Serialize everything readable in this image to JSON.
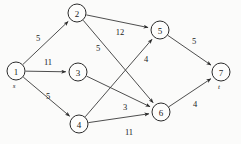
{
  "figure": {
    "type": "directed-network-graph",
    "width": 241,
    "height": 144,
    "background_color": "#fbfbfa",
    "stroke_color": "#3a3a3a",
    "text_color": "#1a1a1a"
  },
  "chart_data": {
    "type": "diagram",
    "title": "",
    "nodes": [
      {
        "id": "1",
        "label": "1",
        "tag": "s",
        "x": 16,
        "y": 71,
        "r": 9
      },
      {
        "id": "2",
        "label": "2",
        "tag": "",
        "x": 77,
        "y": 13,
        "r": 9
      },
      {
        "id": "3",
        "label": "3",
        "tag": "",
        "x": 78,
        "y": 72,
        "r": 9
      },
      {
        "id": "4",
        "label": "4",
        "tag": "",
        "x": 79,
        "y": 124,
        "r": 9
      },
      {
        "id": "5",
        "label": "5",
        "tag": "",
        "x": 160,
        "y": 30,
        "r": 9
      },
      {
        "id": "6",
        "label": "6",
        "tag": "",
        "x": 161,
        "y": 112,
        "r": 9
      },
      {
        "id": "7",
        "label": "7",
        "tag": "t",
        "x": 221,
        "y": 72,
        "r": 9
      }
    ],
    "edges": [
      {
        "from": "1",
        "to": "2",
        "weight": "5",
        "lx": 38,
        "ly": 38
      },
      {
        "from": "1",
        "to": "3",
        "weight": "11",
        "lx": 48,
        "ly": 62
      },
      {
        "from": "1",
        "to": "4",
        "weight": "5",
        "lx": 48,
        "ly": 96
      },
      {
        "from": "2",
        "to": "5",
        "weight": "12",
        "lx": 120,
        "ly": 32
      },
      {
        "from": "2",
        "to": "6",
        "weight": "5",
        "lx": 98,
        "ly": 48
      },
      {
        "from": "3",
        "to": "6",
        "weight": "3",
        "lx": 125,
        "ly": 107
      },
      {
        "from": "4",
        "to": "5",
        "weight": "4",
        "lx": 146,
        "ly": 59
      },
      {
        "from": "4",
        "to": "6",
        "weight": "11",
        "lx": 129,
        "ly": 132
      },
      {
        "from": "5",
        "to": "7",
        "weight": "5",
        "lx": 194,
        "ly": 41
      },
      {
        "from": "6",
        "to": "7",
        "weight": "4",
        "lx": 195,
        "ly": 104
      }
    ]
  }
}
